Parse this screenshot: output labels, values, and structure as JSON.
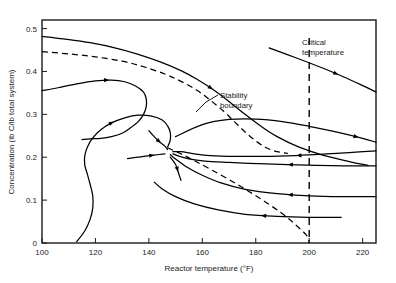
{
  "chart_data": {
    "type": "line",
    "title": "",
    "xlabel": "Reactor temperature (°F)",
    "ylabel": "Concentration (lb C/lb total system)",
    "xlim": [
      100,
      225
    ],
    "ylim": [
      0,
      0.52
    ],
    "xticks": [
      100,
      120,
      140,
      160,
      180,
      200,
      220
    ],
    "xticklabels": [
      "100",
      "120",
      "140",
      "160",
      "180",
      "200",
      "220"
    ],
    "yticks": [
      0,
      0.1,
      0.2,
      0.3,
      0.4,
      0.5
    ],
    "yticklabels": [
      "0",
      "0.1",
      "0.2",
      "0.3",
      "0.4",
      "0.5"
    ],
    "grid": false,
    "legend": "none",
    "annotations": [
      {
        "name": "stability-boundary",
        "text_line1": "Stability",
        "text_line2": "boundary"
      },
      {
        "name": "critical-temperature",
        "text_line1": "Critical",
        "text_line2": "temperature"
      }
    ],
    "critical_temperature": 200,
    "saddle_point": {
      "x": 138,
      "y": 0.207
    },
    "series": [
      {
        "name": "upper-trajectory-1",
        "style": "solid",
        "points": [
          [
            100,
            0.482
          ],
          [
            108,
            0.476
          ],
          [
            118,
            0.467
          ],
          [
            128,
            0.454
          ],
          [
            136,
            0.44
          ],
          [
            144,
            0.423
          ],
          [
            152,
            0.402
          ],
          [
            158,
            0.382
          ],
          [
            164,
            0.358
          ],
          [
            170,
            0.33
          ],
          [
            176,
            0.3
          ],
          [
            182,
            0.272
          ],
          [
            188,
            0.248
          ],
          [
            196,
            0.224
          ],
          [
            205,
            0.205
          ],
          [
            215,
            0.19
          ],
          [
            222,
            0.181
          ]
        ]
      },
      {
        "name": "separatrix-upper",
        "style": "dashed",
        "points": [
          [
            100,
            0.446
          ],
          [
            110,
            0.441
          ],
          [
            120,
            0.434
          ],
          [
            130,
            0.424
          ],
          [
            138,
            0.411
          ],
          [
            146,
            0.394
          ],
          [
            152,
            0.377
          ],
          [
            158,
            0.356
          ],
          [
            163,
            0.333
          ],
          [
            168,
            0.307
          ],
          [
            172,
            0.283
          ],
          [
            176,
            0.259
          ],
          [
            180,
            0.238
          ],
          [
            184,
            0.222
          ],
          [
            188,
            0.213
          ],
          [
            192,
            0.209
          ]
        ]
      },
      {
        "name": "loop-trajectory",
        "style": "solid",
        "points": [
          [
            100,
            0.355
          ],
          [
            106,
            0.362
          ],
          [
            113,
            0.371
          ],
          [
            120,
            0.378
          ],
          [
            126,
            0.38
          ],
          [
            131,
            0.376
          ],
          [
            135,
            0.366
          ],
          [
            138,
            0.352
          ],
          [
            139,
            0.336
          ],
          [
            139,
            0.318
          ],
          [
            138,
            0.3
          ],
          [
            136,
            0.283
          ],
          [
            133,
            0.268
          ],
          [
            130,
            0.256
          ],
          [
            126,
            0.248
          ],
          [
            122,
            0.244
          ],
          [
            118,
            0.243
          ],
          [
            115,
            0.241
          ]
        ]
      },
      {
        "name": "inward-spiral",
        "style": "solid",
        "points": [
          [
            113,
            0.003
          ],
          [
            116,
            0.028
          ],
          [
            118,
            0.055
          ],
          [
            119,
            0.082
          ],
          [
            119,
            0.11
          ],
          [
            118,
            0.137
          ],
          [
            117,
            0.16
          ],
          [
            116,
            0.182
          ],
          [
            116,
            0.203
          ],
          [
            117,
            0.224
          ],
          [
            119,
            0.245
          ],
          [
            122,
            0.264
          ],
          [
            126,
            0.28
          ],
          [
            131,
            0.292
          ],
          [
            136,
            0.298
          ],
          [
            141,
            0.296
          ],
          [
            145,
            0.287
          ],
          [
            147,
            0.273
          ],
          [
            148,
            0.258
          ],
          [
            148,
            0.24
          ],
          [
            147,
            0.224
          ]
        ]
      },
      {
        "name": "upper-right-trajectory",
        "style": "solid",
        "points": [
          [
            185,
            0.455
          ],
          [
            195,
            0.432
          ],
          [
            205,
            0.408
          ],
          [
            213,
            0.387
          ],
          [
            220,
            0.367
          ],
          [
            225,
            0.352
          ]
        ]
      },
      {
        "name": "stability-boundary-branch",
        "style": "solid",
        "points": [
          [
            150,
            0.248
          ],
          [
            160,
            0.276
          ],
          [
            170,
            0.288
          ],
          [
            180,
            0.289
          ],
          [
            190,
            0.283
          ],
          [
            200,
            0.272
          ],
          [
            210,
            0.259
          ],
          [
            220,
            0.244
          ],
          [
            225,
            0.235
          ]
        ]
      },
      {
        "name": "incoming-from-right-upper",
        "style": "solid",
        "points": [
          [
            225,
            0.215
          ],
          [
            215,
            0.211
          ],
          [
            205,
            0.207
          ],
          [
            195,
            0.204
          ],
          [
            183,
            0.202
          ],
          [
            172,
            0.202
          ],
          [
            163,
            0.204
          ],
          [
            157,
            0.208
          ],
          [
            152,
            0.213
          ],
          [
            149,
            0.213
          ]
        ]
      },
      {
        "name": "incoming-from-right-mid",
        "style": "solid",
        "points": [
          [
            225,
            0.18
          ],
          [
            214,
            0.18
          ],
          [
            203,
            0.181
          ],
          [
            192,
            0.183
          ],
          [
            181,
            0.185
          ],
          [
            170,
            0.188
          ],
          [
            161,
            0.191
          ],
          [
            155,
            0.196
          ],
          [
            151,
            0.203
          ],
          [
            149,
            0.208
          ]
        ]
      },
      {
        "name": "incoming-from-right-low",
        "style": "solid",
        "points": [
          [
            225,
            0.108
          ],
          [
            212,
            0.108
          ],
          [
            200,
            0.11
          ],
          [
            188,
            0.115
          ],
          [
            176,
            0.125
          ],
          [
            167,
            0.14
          ],
          [
            160,
            0.158
          ],
          [
            154,
            0.178
          ],
          [
            150,
            0.196
          ],
          [
            148,
            0.206
          ]
        ]
      },
      {
        "name": "incoming-from-right-lowest",
        "style": "solid",
        "points": [
          [
            212,
            0.06
          ],
          [
            200,
            0.06
          ],
          [
            188,
            0.062
          ],
          [
            176,
            0.067
          ],
          [
            166,
            0.077
          ],
          [
            157,
            0.091
          ],
          [
            150,
            0.108
          ],
          [
            145,
            0.126
          ],
          [
            142,
            0.142
          ]
        ]
      },
      {
        "name": "separatrix-lower",
        "style": "dashed",
        "points": [
          [
            147,
            0.222
          ],
          [
            152,
            0.208
          ],
          [
            157,
            0.192
          ],
          [
            163,
            0.172
          ],
          [
            170,
            0.148
          ],
          [
            177,
            0.122
          ],
          [
            184,
            0.094
          ],
          [
            190,
            0.068
          ],
          [
            195,
            0.042
          ],
          [
            199,
            0.018
          ],
          [
            200,
            0.002
          ]
        ]
      },
      {
        "name": "saddle-upper-left-in",
        "style": "solid",
        "points": [
          [
            140,
            0.262
          ],
          [
            142,
            0.248
          ],
          [
            144,
            0.236
          ],
          [
            146,
            0.226
          ],
          [
            147,
            0.218
          ]
        ]
      },
      {
        "name": "saddle-left-in",
        "style": "solid",
        "points": [
          [
            132,
            0.197
          ],
          [
            137,
            0.201
          ],
          [
            142,
            0.205
          ],
          [
            146,
            0.208
          ]
        ]
      },
      {
        "name": "saddle-lower-out",
        "style": "solid",
        "points": [
          [
            148,
            0.2
          ],
          [
            150,
            0.183
          ],
          [
            151,
            0.165
          ],
          [
            152,
            0.146
          ]
        ]
      }
    ]
  }
}
